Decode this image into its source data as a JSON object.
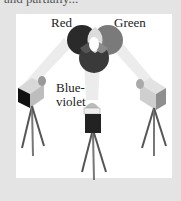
{
  "figure": {
    "cropped_caption_text": "and partially...",
    "labels": {
      "red": "Red",
      "green": "Green",
      "blue_line1": "Blue-",
      "blue_line2": "violet"
    },
    "colors": {
      "background": "#e4e4e4",
      "panel": "#ffffff",
      "red_circle": "#2a2a2a",
      "green_circle": "#7a7a7a",
      "blue_circle": "#3a3a3a",
      "overlap_center": "#ffffff",
      "beam": "#e8e8e8"
    },
    "projectors": [
      {
        "name": "red-projector",
        "position": "left"
      },
      {
        "name": "blue-violet-projector",
        "position": "center"
      },
      {
        "name": "green-projector",
        "position": "right"
      }
    ]
  }
}
